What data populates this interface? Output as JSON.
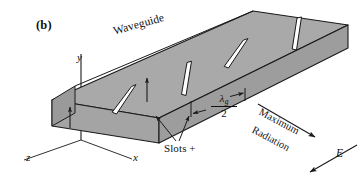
{
  "figure": {
    "panel_letter": "(b)",
    "title_label": "Waveguide",
    "slots_label": "Slots +",
    "maximum_label": "Maximum",
    "radiation_label": "Radiation",
    "e_field_label": "E",
    "spacing": {
      "symbol": "λ",
      "subscript": "g",
      "denominator": "2",
      "meaning": "λ_g/2"
    },
    "axes": {
      "y": "y",
      "x": "x",
      "z": "z"
    },
    "colors": {
      "top_face": "#a9a9a9",
      "front_face": "#a3a3a3",
      "end_face": "#9a9a9a",
      "slot_fill": "#ffffff",
      "outline": "#1a1a1a",
      "background": "#ffffff"
    },
    "slot_count": 4
  }
}
